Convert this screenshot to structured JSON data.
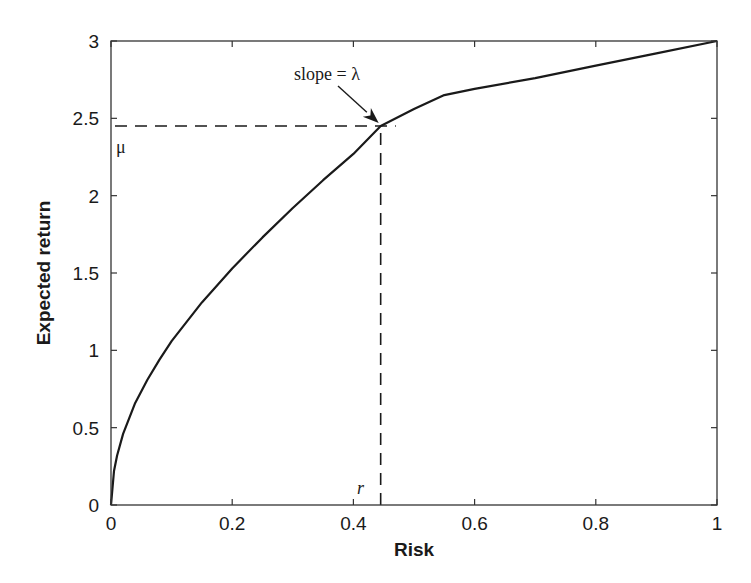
{
  "chart_data": {
    "type": "line",
    "title": "",
    "xlabel": "Risk",
    "ylabel": "Expected return",
    "xlim": [
      0,
      1
    ],
    "ylim": [
      0,
      3
    ],
    "grid": false,
    "legend": null,
    "x_ticks": [
      "0",
      "0.2",
      "0.4",
      "0.6",
      "0.8",
      "1"
    ],
    "y_ticks": [
      "0",
      "0.5",
      "1",
      "1.5",
      "2",
      "2.5",
      "3"
    ],
    "series": [
      {
        "name": "efficient frontier",
        "style": "solid",
        "x": [
          0,
          0.005,
          0.01,
          0.02,
          0.04,
          0.06,
          0.08,
          0.1,
          0.15,
          0.2,
          0.25,
          0.3,
          0.35,
          0.4,
          0.445,
          0.5,
          0.55,
          0.6,
          0.7,
          0.8,
          0.9,
          1.0
        ],
        "y": [
          0,
          0.22,
          0.32,
          0.46,
          0.66,
          0.81,
          0.94,
          1.06,
          1.31,
          1.53,
          1.73,
          1.92,
          2.1,
          2.27,
          2.45,
          2.56,
          2.65,
          2.69,
          2.76,
          2.84,
          2.92,
          3.0
        ]
      }
    ],
    "annotations": [
      {
        "text": "slope = λ",
        "x": 0.31,
        "y": 2.75,
        "arrow_to": [
          0.445,
          2.45
        ]
      },
      {
        "text": "μ",
        "x": 0.01,
        "y": 2.33,
        "desc": "dashed horizontal guide at expected return ≈ 2.45"
      },
      {
        "text": "r",
        "x": 0.41,
        "y": 0.1,
        "desc": "dashed vertical guide at risk ≈ 0.445"
      }
    ],
    "reference_lines": [
      {
        "orientation": "horizontal",
        "value": 2.45,
        "from": 0,
        "to": 0.47,
        "style": "dashed"
      },
      {
        "orientation": "vertical",
        "value": 0.445,
        "from": 0,
        "to": 2.45,
        "style": "dashed"
      }
    ]
  },
  "labels": {
    "xlabel": "Risk",
    "ylabel": "Expected return",
    "slope": "slope = λ",
    "mu": "μ",
    "r": "r"
  },
  "colors": {
    "line": "#1a1a1a",
    "axis": "#333333",
    "background": "#ffffff"
  }
}
